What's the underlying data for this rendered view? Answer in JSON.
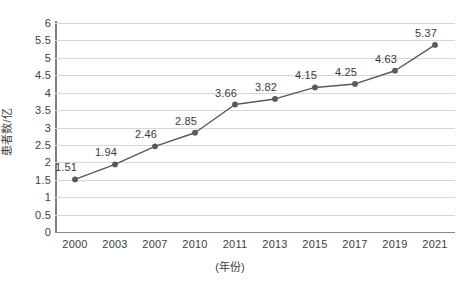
{
  "chart_data": {
    "type": "line",
    "title": "",
    "xlabel": "(年份)",
    "ylabel": "患者数/亿",
    "categories": [
      "2000",
      "2003",
      "2007",
      "2010",
      "2011",
      "2013",
      "2015",
      "2017",
      "2019",
      "2021"
    ],
    "values": [
      1.51,
      1.94,
      2.46,
      2.85,
      3.66,
      3.82,
      4.15,
      4.25,
      4.63,
      5.37
    ],
    "data_labels": [
      "1.51",
      "1.94",
      "2.46",
      "2.85",
      "3.66",
      "3.82",
      "4.15",
      "4.25",
      "4.63",
      "5.37"
    ],
    "ylim": [
      0,
      6
    ],
    "ytick_labels": [
      "0",
      "0.5",
      "1",
      "1.5",
      "2",
      "2.5",
      "3",
      "3.5",
      "4",
      "4.5",
      "5",
      "5.5",
      "6"
    ],
    "ytick_values": [
      0,
      0.5,
      1,
      1.5,
      2,
      2.5,
      3,
      3.5,
      4,
      4.5,
      5,
      5.5,
      6
    ],
    "ystep": 0.5,
    "grid": true,
    "legend": "none",
    "series": [
      {
        "name": "患者数",
        "values": [
          1.51,
          1.94,
          2.46,
          2.85,
          3.66,
          3.82,
          4.15,
          4.25,
          4.63,
          5.37
        ],
        "marker": "circle",
        "color": "#595959"
      }
    ],
    "colors": {
      "line": "#595959",
      "marker": "#595959",
      "gridline": "#d6d6d6",
      "axis": "#808080",
      "text": "#404040",
      "background": "#ffffff"
    }
  }
}
